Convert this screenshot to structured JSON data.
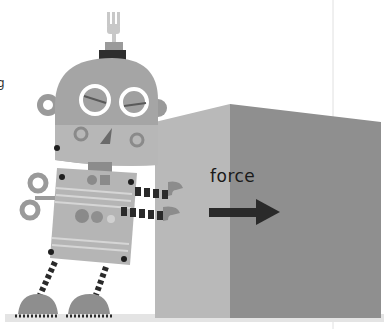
{
  "illustration": {
    "subject": "robot pushing a box",
    "label_force": "force",
    "edge_text": "g",
    "colors": {
      "background": "#ffffff",
      "box_side": "#b9b9b9",
      "box_front": "#8f8f8f",
      "robot_body": "#a8a8a8",
      "robot_dark": "#3a3a3a",
      "arrow": "#2a2a2a"
    }
  }
}
